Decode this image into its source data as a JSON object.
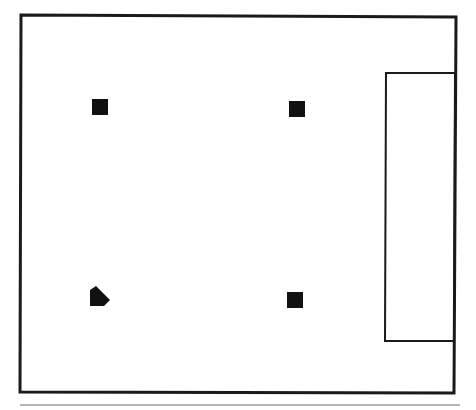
{
  "diagram": {
    "colors": {
      "background": "#ffffff",
      "stroke": "#1a1a1a",
      "fill": "#111111",
      "rule": "#b5b5b5"
    },
    "field": {
      "points": "21,15 456,17 454,393 20,392"
    },
    "side_box": {
      "points": "386,73 455,73 454,341 385,341"
    },
    "markers": [
      {
        "name": "base-top-left",
        "shape": "square",
        "x": 92,
        "y": 99,
        "w": 16,
        "h": 16
      },
      {
        "name": "base-top-right",
        "shape": "square",
        "x": 289,
        "y": 101,
        "w": 16,
        "h": 16
      },
      {
        "name": "base-bottom-right",
        "shape": "square",
        "x": 287,
        "y": 292,
        "w": 16,
        "h": 16
      },
      {
        "name": "home-plate",
        "shape": "pentagon",
        "points": "90,290 96,286 110,300 104,306 90,306"
      }
    ],
    "bottom_rule": {
      "x1": 20,
      "y1": 405,
      "x2": 460,
      "y2": 405
    }
  }
}
